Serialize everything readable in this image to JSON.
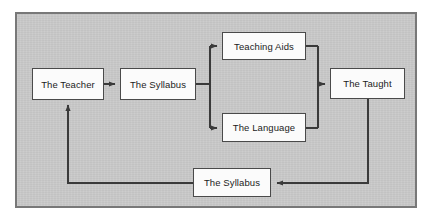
{
  "diagram": {
    "background_color": "#c9c9c9",
    "frame_border_color": "#787878",
    "node_fill_color": "#fbfbfb",
    "node_border_color": "#4a4a4a",
    "connector_color": "#3a3a3a",
    "nodes": [
      {
        "id": "teacher",
        "label": "The Teacher"
      },
      {
        "id": "syllabus_top",
        "label": "The Syllabus"
      },
      {
        "id": "teaching_aids",
        "label": "Teaching Aids"
      },
      {
        "id": "language",
        "label": "The Language"
      },
      {
        "id": "taught",
        "label": "The Taught"
      },
      {
        "id": "syllabus_bot",
        "label": "The Syllabus"
      }
    ],
    "edges": [
      {
        "from": "teacher",
        "to": "syllabus_top",
        "direction": "right"
      },
      {
        "from": "syllabus_top",
        "to": "teaching_aids",
        "direction": "right-up"
      },
      {
        "from": "syllabus_top",
        "to": "language",
        "direction": "right-down"
      },
      {
        "from": "teaching_aids",
        "to": "taught",
        "direction": "right-down"
      },
      {
        "from": "language",
        "to": "taught",
        "direction": "right-up"
      },
      {
        "from": "taught",
        "to": "syllabus_bot",
        "direction": "down-left"
      },
      {
        "from": "syllabus_bot",
        "to": "teacher",
        "direction": "left-up"
      }
    ]
  }
}
